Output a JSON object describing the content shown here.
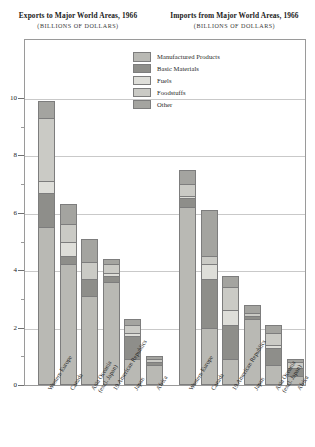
{
  "exports_panel": {
    "title": "Exports to Major World Areas, 1966",
    "subtitle": "(BILLIONS OF DOLLARS)"
  },
  "imports_panel": {
    "title": "Imports from Major World Areas, 1966",
    "subtitle": "(BILLIONS OF DOLLARS)"
  },
  "legend": {
    "items": [
      {
        "label": "Manufactured Products",
        "color": "#b9b9b4"
      },
      {
        "label": "Basic Materials",
        "color": "#8e8e8a"
      },
      {
        "label": "Fuels",
        "color": "#deded9"
      },
      {
        "label": "Foodstuffs",
        "color": "#cacac5"
      },
      {
        "label": "Other",
        "color": "#a4a4a0"
      }
    ]
  },
  "yaxis": {
    "major_ticks": [
      "0",
      "2",
      "4",
      "6",
      "8",
      "10"
    ],
    "major_values": [
      0,
      2,
      4,
      6,
      8,
      10
    ],
    "minor_values": [
      1,
      3,
      5,
      7,
      9
    ],
    "min": 0,
    "max": 10.6
  },
  "chart_data": {
    "type": "bar",
    "ylabel": "BILLIONS OF DOLLARS",
    "xlabel": "",
    "ylim": [
      0,
      10.6
    ],
    "grid": true,
    "stacked": true,
    "legend_position": "inside-top-center",
    "series_names": [
      "Manufactured Products",
      "Basic Materials",
      "Fuels",
      "Foodstuffs",
      "Other"
    ],
    "series_colors": [
      "#b9b9b4",
      "#8e8e8a",
      "#deded9",
      "#cacac5",
      "#a4a4a0"
    ],
    "panels": [
      {
        "name": "Exports to Major World Areas, 1966",
        "categories": [
          "Western Europe",
          "Canada",
          "Asia Oceania (excl. Japan)",
          "19 American Republics",
          "Japan",
          "Africa"
        ],
        "series": [
          {
            "name": "Manufactured Products",
            "values": [
              5.5,
              4.2,
              3.1,
              3.6,
              0.9,
              0.7
            ]
          },
          {
            "name": "Basic Materials",
            "values": [
              1.2,
              0.3,
              0.6,
              0.2,
              0.8,
              0.1
            ]
          },
          {
            "name": "Fuels",
            "values": [
              0.4,
              0.5,
              0.0,
              0.1,
              0.1,
              0.0
            ]
          },
          {
            "name": "Foodstuffs",
            "values": [
              2.2,
              0.6,
              0.6,
              0.3,
              0.3,
              0.1
            ]
          },
          {
            "name": "Other",
            "values": [
              0.6,
              0.7,
              0.8,
              0.2,
              0.2,
              0.1
            ]
          }
        ],
        "totals": [
          9.9,
          6.3,
          5.1,
          4.4,
          2.3,
          1.0
        ]
      },
      {
        "name": "Imports from Major World Areas, 1966",
        "categories": [
          "Western Europe",
          "Canada",
          "19 American Republics",
          "Japan",
          "Asia Oceania (excl. Japan)",
          "Africa"
        ],
        "series": [
          {
            "name": "Manufactured Products",
            "values": [
              6.2,
              2.0,
              0.9,
              2.3,
              0.7,
              0.3
            ]
          },
          {
            "name": "Basic Materials",
            "values": [
              0.3,
              1.7,
              1.2,
              0.1,
              0.6,
              0.3
            ]
          },
          {
            "name": "Fuels",
            "values": [
              0.1,
              0.5,
              0.5,
              0.0,
              0.1,
              0.0
            ]
          },
          {
            "name": "Foodstuffs",
            "values": [
              0.4,
              0.3,
              0.8,
              0.1,
              0.4,
              0.2
            ]
          },
          {
            "name": "Other",
            "values": [
              0.5,
              1.6,
              0.4,
              0.3,
              0.3,
              0.1
            ]
          }
        ],
        "totals": [
          7.5,
          6.1,
          3.8,
          2.8,
          2.1,
          0.9
        ]
      }
    ]
  }
}
